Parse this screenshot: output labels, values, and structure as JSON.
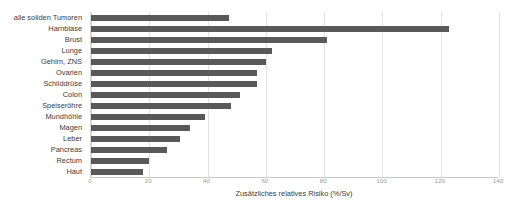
{
  "chart_data": {
    "type": "bar",
    "orientation": "horizontal",
    "title": "",
    "xlabel": "Zusätzliches relatives Risiko (%/Sv)",
    "ylabel": "",
    "xlim": [
      0,
      140
    ],
    "xticks": [
      0,
      20,
      40,
      60,
      80,
      100,
      120,
      140
    ],
    "grid": true,
    "legend": false,
    "bar_color": "#595959",
    "grid_color": "#e3e3e3",
    "categories": [
      "alle soliden Tumoren",
      "Harnblase",
      "Brust",
      "Lunge",
      "Gehirn, ZNS",
      "Ovarien",
      "Schilddrüse",
      "Colon",
      "Speiseröhre",
      "Mundhöhle",
      "Magen",
      "Leber",
      "Pancreas",
      "Rectum",
      "Haut"
    ],
    "values": [
      47.5,
      123,
      81,
      62,
      60,
      57,
      57,
      51,
      48,
      39,
      34,
      30.5,
      26,
      20,
      18
    ]
  }
}
